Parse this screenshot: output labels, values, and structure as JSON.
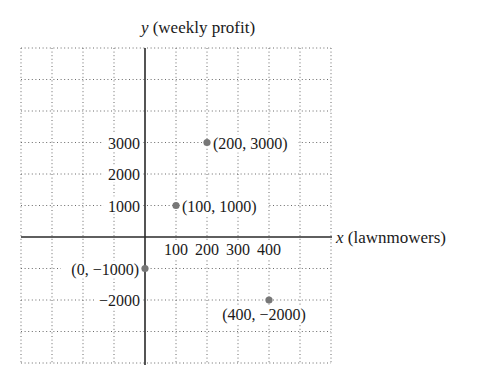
{
  "chart_data": {
    "type": "scatter",
    "title": "",
    "xlabel_var": "x",
    "xlabel_desc": "(lawnmowers)",
    "ylabel_var": "y",
    "ylabel_desc": "(weekly profit)",
    "x_ticks": [
      100,
      200,
      300,
      400
    ],
    "x_tick_labels": [
      "100",
      "200",
      "300",
      "400"
    ],
    "y_ticks": [
      3000,
      2000,
      1000,
      -2000
    ],
    "y_tick_labels": [
      "3000",
      "2000",
      "1000",
      "−2000"
    ],
    "xlim": [
      -400,
      600
    ],
    "ylim": [
      -4000,
      6000
    ],
    "x_grid_step": 100,
    "y_grid_step": 1000,
    "grid": true,
    "points": [
      {
        "x": 200,
        "y": 3000,
        "label": "(200, 3000)",
        "label_side": "right"
      },
      {
        "x": 100,
        "y": 1000,
        "label": "(100, 1000)",
        "label_side": "right"
      },
      {
        "x": 0,
        "y": -1000,
        "label": "(0, −1000)",
        "label_side": "left"
      },
      {
        "x": 400,
        "y": -2000,
        "label": "(400, −2000)",
        "label_side": "below"
      }
    ],
    "point_color": "#777777"
  }
}
